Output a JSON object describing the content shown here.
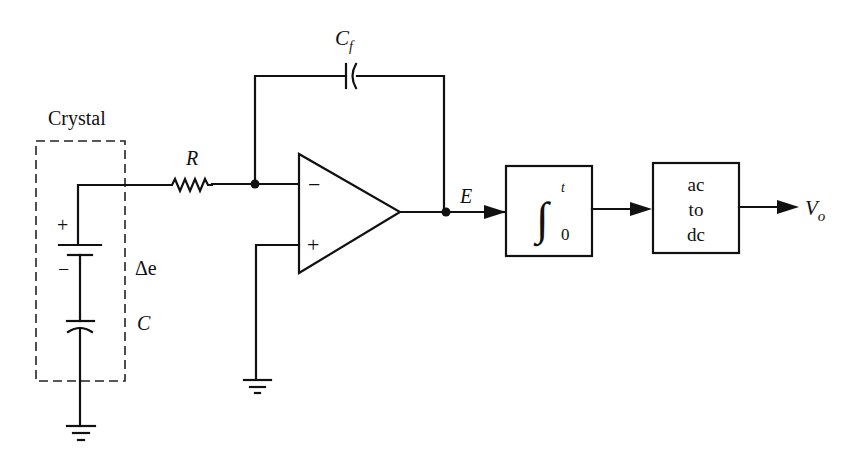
{
  "diagram": {
    "type": "circuit-block-diagram",
    "crystal_box_label": "Crystal",
    "components": {
      "resistor": {
        "label": "R"
      },
      "feedback_capacitor": {
        "label": "C",
        "label_subscript": "f"
      },
      "voltage_source": {
        "label": "Δe",
        "plus": "+",
        "minus": "−"
      },
      "crystal_capacitor": {
        "label": "C"
      },
      "opamp": {
        "inverting": "−",
        "noninverting": "+"
      }
    },
    "signals": {
      "opamp_output": "E",
      "final_output": "V",
      "final_output_subscript": "o"
    },
    "blocks": [
      {
        "id": "integrator",
        "upper_limit": "t",
        "lower_limit": "0",
        "symbol": "∫"
      },
      {
        "id": "ac-to-dc",
        "lines": [
          "ac",
          "to",
          "dc"
        ]
      }
    ]
  }
}
